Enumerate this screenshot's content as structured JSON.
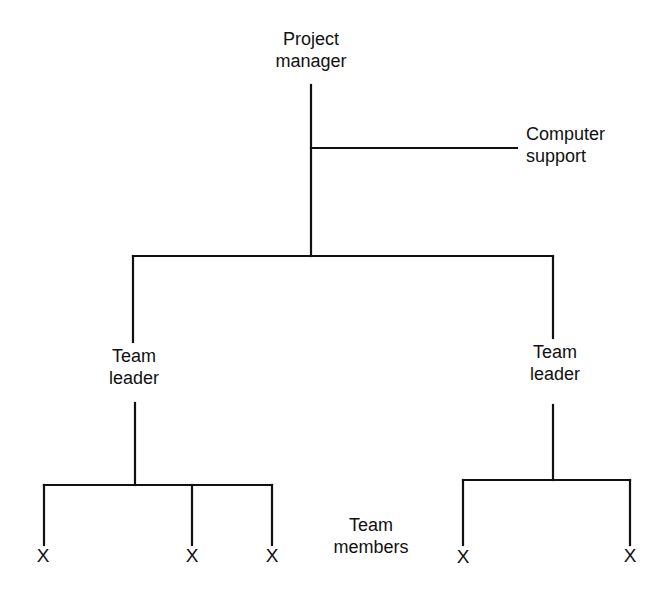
{
  "diagram": {
    "type": "organization-chart",
    "nodes": {
      "project_manager": {
        "line1": "Project",
        "line2": "manager"
      },
      "computer_support": {
        "line1": "Computer",
        "line2": "support"
      },
      "team_leader_left": {
        "line1": "Team",
        "line2": "leader"
      },
      "team_leader_right": {
        "line1": "Team",
        "line2": "leader"
      },
      "team_members_label": {
        "line1": "Team",
        "line2": "members"
      }
    },
    "members_left": [
      "X",
      "X",
      "X"
    ],
    "members_right": [
      "X",
      "X"
    ],
    "edges": [
      [
        "Project manager",
        "Computer support"
      ],
      [
        "Project manager",
        "Team leader (left)"
      ],
      [
        "Project manager",
        "Team leader (right)"
      ],
      [
        "Team leader (left)",
        "X"
      ],
      [
        "Team leader (left)",
        "X"
      ],
      [
        "Team leader (left)",
        "X"
      ],
      [
        "Team leader (right)",
        "X"
      ],
      [
        "Team leader (right)",
        "X"
      ]
    ],
    "line_color": "#111111"
  }
}
